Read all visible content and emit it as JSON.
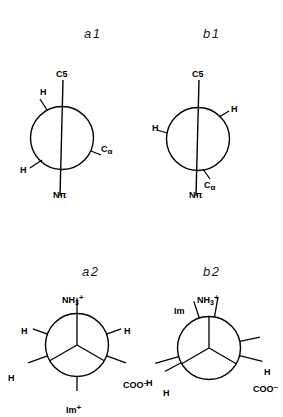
{
  "figure": {
    "background_color": "#ffffff",
    "stroke_color": "#000000",
    "width": 283,
    "height": 417
  },
  "panels": [
    {
      "id": "a1",
      "label": "a1",
      "type": "newman-projection",
      "label_x": 84,
      "label_y": 26,
      "circle": {
        "cx": 62,
        "cy": 138,
        "r": 31.5
      },
      "axis": {
        "name": "C5-Npi-axis",
        "x1": 63,
        "y1": 80,
        "x2": 60,
        "y2": 196
      },
      "axis_labels": [
        {
          "name": "c5-label",
          "text": "C5",
          "x": 56,
          "y": 70,
          "html": "C5"
        },
        {
          "name": "n-pi-label",
          "text": "Nπ",
          "x": 53,
          "y": 191,
          "html": "N<span class=\"pi\">π</span>"
        }
      ],
      "substituents": [
        {
          "name": "h-upper-left",
          "text": "H",
          "angle_deg": 118,
          "label_x": 40,
          "label_y": 88,
          "stub": {
            "x1": 47,
            "y1": 110,
            "x2": 40,
            "y2": 99
          }
        },
        {
          "name": "c-alpha-right",
          "text": "Cα",
          "angle_deg": -22,
          "label_x": 101,
          "label_y": 145,
          "stub": {
            "x1": 91,
            "y1": 151,
            "x2": 101,
            "y2": 155
          }
        },
        {
          "name": "h-lower-left",
          "text": "H",
          "angle_deg": 212,
          "label_x": 20,
          "label_y": 166,
          "stub": {
            "x1": 42,
            "y1": 160,
            "x2": 30,
            "y2": 168
          }
        }
      ]
    },
    {
      "id": "b1",
      "label": "b1",
      "type": "newman-projection",
      "label_x": 203,
      "label_y": 26,
      "circle": {
        "cx": 198,
        "cy": 139,
        "r": 31.5
      },
      "axis": {
        "name": "C5-Npi-axis",
        "x1": 199,
        "y1": 80,
        "x2": 196,
        "y2": 196
      },
      "axis_labels": [
        {
          "name": "c5-label",
          "text": "C5",
          "x": 192,
          "y": 70,
          "html": "C5"
        },
        {
          "name": "n-pi-label",
          "text": "Nπ",
          "x": 189,
          "y": 191,
          "html": "N<span class=\"pi\">π</span>"
        }
      ],
      "substituents": [
        {
          "name": "h-upper-right",
          "text": "H",
          "angle_deg": 48,
          "label_x": 231,
          "label_y": 105,
          "stub": {
            "x1": 219,
            "y1": 117,
            "x2": 229,
            "y2": 111
          }
        },
        {
          "name": "h-left",
          "text": "H",
          "angle_deg": 172,
          "label_x": 152,
          "label_y": 124,
          "stub": {
            "x1": 167,
            "y1": 133,
            "x2": 157,
            "y2": 130
          }
        },
        {
          "name": "c-alpha-lower-right",
          "text": "Cα",
          "angle_deg": -72,
          "label_x": 204,
          "label_y": 181,
          "stub": {
            "x1": 203,
            "y1": 169,
            "x2": 210,
            "y2": 179
          }
        }
      ]
    },
    {
      "id": "a2",
      "label": "a2",
      "type": "newman-projection",
      "label_x": 82,
      "label_y": 264,
      "circle": {
        "cx": 77,
        "cy": 345,
        "r": 31.5
      },
      "back_bonds": [
        {
          "name": "back-bond-upper",
          "angle_deg": 90,
          "length": 31.5
        },
        {
          "name": "back-bond-lower-left",
          "angle_deg": 210,
          "length": 31.5
        },
        {
          "name": "back-bond-lower-right",
          "angle_deg": 330,
          "length": 31.5
        }
      ],
      "front_bonds": [
        {
          "name": "front-bond-nh3",
          "angle_deg": 90,
          "inner": 31.5,
          "outer": 47
        },
        {
          "name": "front-bond-h-left",
          "angle_deg": 160,
          "inner": 31.5,
          "outer": 47
        },
        {
          "name": "front-bond-h-right",
          "angle_deg": 20,
          "inner": 31.5,
          "outer": 47
        },
        {
          "name": "front-bond-h-lower-left",
          "angle_deg": 200,
          "inner": 31.5,
          "outer": 52
        },
        {
          "name": "front-bond-coo",
          "angle_deg": -20,
          "inner": 31.5,
          "outer": 52
        },
        {
          "name": "front-bond-im",
          "angle_deg": -90,
          "inner": 31.5,
          "outer": 46
        }
      ],
      "substituent_labels": [
        {
          "name": "nh3-label",
          "text": "NH3+",
          "x": 62,
          "y": 294,
          "html": "NH<sub>3</sub><sup>+</sup>"
        },
        {
          "name": "h-left-label",
          "text": "H",
          "x": 21,
          "y": 327,
          "html": "H"
        },
        {
          "name": "h-right-label",
          "text": "H",
          "x": 124,
          "y": 327,
          "html": "H"
        },
        {
          "name": "h-lower-left-label",
          "text": "H",
          "x": 8,
          "y": 374,
          "html": "H"
        },
        {
          "name": "coo-label",
          "text": "COO-",
          "x": 123,
          "y": 379,
          "html": "COO<sup>–</sup>"
        },
        {
          "name": "im-label",
          "text": "Im+",
          "x": 66,
          "y": 404,
          "html": "Im<sup>+</sup>"
        }
      ]
    },
    {
      "id": "b2",
      "label": "b2",
      "type": "newman-projection",
      "label_x": 203,
      "label_y": 264,
      "circle": {
        "cx": 209,
        "cy": 348,
        "r": 31.5
      },
      "back_bonds": [
        {
          "name": "back-bond-upper",
          "angle_deg": 90,
          "length": 31.5
        },
        {
          "name": "back-bond-lower-left",
          "angle_deg": 210,
          "length": 31.5
        },
        {
          "name": "back-bond-lower-right",
          "angle_deg": 330,
          "length": 31.5
        }
      ],
      "front_bonds": [
        {
          "name": "front-bond-nh3",
          "angle_deg": 80,
          "inner": 31.5,
          "outer": 52
        },
        {
          "name": "front-bond-im",
          "angle_deg": 108,
          "inner": 31.5,
          "outer": 49
        },
        {
          "name": "front-bond-h-upper-right",
          "angle_deg": 12,
          "inner": 31.5,
          "outer": 52
        },
        {
          "name": "front-bond-coo",
          "angle_deg": -14,
          "inner": 31.5,
          "outer": 55
        },
        {
          "name": "front-bond-h-left",
          "angle_deg": 196,
          "inner": 31.5,
          "outer": 56
        },
        {
          "name": "front-bond-h-lower-left",
          "angle_deg": 208,
          "inner": 31.5,
          "outer": 50
        }
      ],
      "substituent_labels": [
        {
          "name": "nh3-label",
          "text": "NH3+",
          "x": 197,
          "y": 294,
          "html": "NH<sub>3</sub><sup>+</sup>"
        },
        {
          "name": "im-label",
          "text": "Im",
          "x": 174,
          "y": 307,
          "html": "Im"
        },
        {
          "name": "h-upper-right-label",
          "text": "H",
          "x": 264,
          "y": 368,
          "html": "H"
        },
        {
          "name": "coo-label",
          "text": "COO-",
          "x": 253,
          "y": 383,
          "html": "COO<sup>–</sup>"
        },
        {
          "name": "h-left-label",
          "text": "H",
          "x": 146,
          "y": 379,
          "html": "H"
        },
        {
          "name": "h-lower-left-label",
          "text": "H",
          "x": 163,
          "y": 389,
          "html": "H"
        }
      ]
    }
  ]
}
